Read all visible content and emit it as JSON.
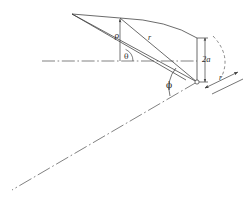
{
  "figure": {
    "background_color": "#ffffff",
    "line_color": "#3a3a3a",
    "text_color": "#2b2b2b",
    "width": 248,
    "height": 204
  },
  "labels": {
    "rho": "ρ",
    "r_chord": "r",
    "theta": "θ",
    "two_a": "2a",
    "phi": "ϕ",
    "r_edge": "r"
  },
  "geometry": {
    "apex": {
      "x": 72,
      "y": 14
    },
    "origin": {
      "x": 197,
      "y": 82
    },
    "upper_node": {
      "x": 120,
      "y": 18
    },
    "tip_upper": {
      "x": 197,
      "y": 38
    },
    "axis_y": 61,
    "axis_x_start": 42,
    "axis_x_end": 197,
    "centerline_end": {
      "x": 12,
      "y": 190
    }
  },
  "elements": {
    "horizontal_axis_name": "horizontal-centerline",
    "oblique_axis_name": "oblique-centerline",
    "leading_edge_name": "leading-edge",
    "trailing_edge_name": "trailing-edge",
    "curved_edge_name": "curved-tip-arc",
    "rho_dim_name": "rho-dimension-line",
    "two_a_dim_name": "two-a-dimension-line",
    "theta_arc_name": "theta-angle-arc",
    "phi_arc_name": "phi-angle-arc",
    "r_ray_name": "r-radius-ray",
    "origin_marker_name": "origin-point-marker"
  }
}
